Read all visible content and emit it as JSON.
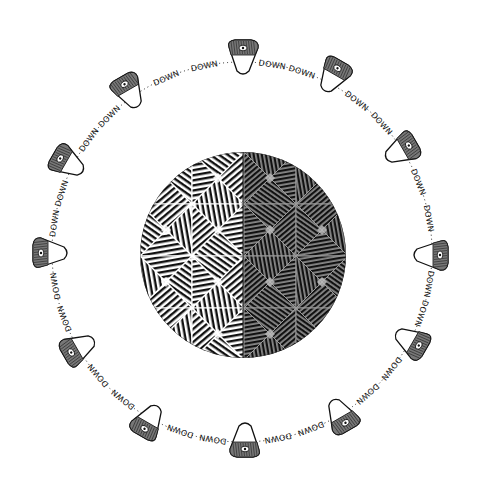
{
  "illustration": {
    "background": "#ffffff",
    "ink": "#111111",
    "center": {
      "x": 242,
      "y": 252
    },
    "ring_radius": 190,
    "sphere": {
      "cx": 243,
      "cy": 255,
      "r": 103,
      "left_tone": "#f2f2f2",
      "right_tone": "#8a8a8a",
      "pattern": "geodesic-hatched-facets"
    },
    "ring_label": "DOWN",
    "nodes": [
      {
        "x": 243,
        "y": 57,
        "rot": 0
      },
      {
        "x": 333,
        "y": 76,
        "rot": 30
      },
      {
        "x": 401,
        "y": 150,
        "rot": 60
      },
      {
        "x": 431,
        "y": 255,
        "rot": 90
      },
      {
        "x": 411,
        "y": 341,
        "rot": 120
      },
      {
        "x": 341,
        "y": 415,
        "rot": 150
      },
      {
        "x": 245,
        "y": 440,
        "rot": 180
      },
      {
        "x": 149,
        "y": 421,
        "rot": 210
      },
      {
        "x": 79,
        "y": 348,
        "rot": 240
      },
      {
        "x": 50,
        "y": 253,
        "rot": 270
      },
      {
        "x": 68,
        "y": 163,
        "rot": 300
      },
      {
        "x": 129,
        "y": 92,
        "rot": 330
      }
    ]
  }
}
